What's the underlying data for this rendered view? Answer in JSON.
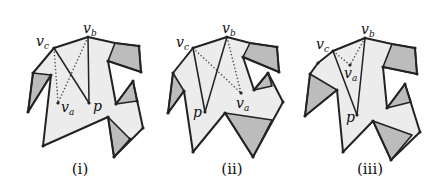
{
  "style": {
    "light_fill": "#ececec",
    "dark_fill": "#bcbcbc",
    "stroke": "#222222",
    "dotted": "#444444"
  },
  "figures": [
    {
      "caption": "(i)",
      "caption_x": 80,
      "outline": [
        [
          54,
          48
        ],
        [
          88,
          37
        ],
        [
          115,
          43
        ],
        [
          139,
          46
        ],
        [
          141,
          72
        ],
        [
          108,
          61
        ],
        [
          116,
          104
        ],
        [
          133,
          81
        ],
        [
          143,
          128
        ],
        [
          114,
          157
        ],
        [
          108,
          117
        ],
        [
          43,
          146
        ],
        [
          51,
          75
        ],
        [
          28,
          112
        ],
        [
          33,
          73
        ]
      ],
      "dark": [
        [
          [
            115,
            43
          ],
          [
            139,
            46
          ],
          [
            141,
            72
          ],
          [
            108,
            61
          ]
        ],
        [
          [
            116,
            104
          ],
          [
            133,
            81
          ],
          [
            137,
            101
          ]
        ],
        [
          [
            108,
            117
          ],
          [
            130,
            139
          ],
          [
            114,
            157
          ]
        ],
        [
          [
            33,
            73
          ],
          [
            51,
            75
          ],
          [
            28,
            112
          ]
        ]
      ],
      "solid_segments": [
        [
          [
            54,
            48
          ],
          [
            89,
            103
          ]
        ],
        [
          [
            88,
            37
          ],
          [
            89,
            103
          ]
        ]
      ],
      "dotted_segments": [
        [
          [
            54,
            48
          ],
          [
            58,
            103
          ]
        ],
        [
          [
            88,
            37
          ],
          [
            58,
            103
          ]
        ]
      ],
      "dots": [
        [
          54,
          48
        ],
        [
          88,
          37
        ],
        [
          139,
          46
        ],
        [
          141,
          72
        ],
        [
          108,
          61
        ],
        [
          133,
          81
        ],
        [
          116,
          104
        ],
        [
          143,
          128
        ],
        [
          114,
          157
        ],
        [
          130,
          139
        ],
        [
          43,
          146
        ],
        [
          28,
          112
        ],
        [
          33,
          73
        ],
        [
          51,
          75
        ],
        [
          58,
          103
        ],
        [
          89,
          103
        ],
        [
          137,
          101
        ],
        [
          108,
          117
        ]
      ],
      "labels": [
        {
          "main": "v",
          "sub": "c",
          "x": 36,
          "y": 46
        },
        {
          "main": "v",
          "sub": "b",
          "x": 83,
          "y": 33
        },
        {
          "main": "v",
          "sub": "a",
          "x": 61,
          "y": 112
        },
        {
          "main": "p",
          "sub": "",
          "x": 93,
          "y": 111
        }
      ]
    },
    {
      "caption": "(ii)",
      "caption_x": 232,
      "outline": [
        [
          193,
          48
        ],
        [
          227,
          37
        ],
        [
          250,
          43
        ],
        [
          277,
          47
        ],
        [
          279,
          72
        ],
        [
          243,
          57
        ],
        [
          254,
          90
        ],
        [
          268,
          73
        ],
        [
          283,
          102
        ],
        [
          253,
          157
        ],
        [
          225,
          113
        ],
        [
          193,
          152
        ],
        [
          184,
          91
        ],
        [
          168,
          113
        ],
        [
          173,
          73
        ]
      ],
      "dark": [
        [
          [
            250,
            43
          ],
          [
            277,
            47
          ],
          [
            279,
            72
          ],
          [
            243,
            57
          ]
        ],
        [
          [
            254,
            90
          ],
          [
            268,
            73
          ],
          [
            272,
            86
          ]
        ],
        [
          [
            225,
            113
          ],
          [
            272,
            120
          ],
          [
            253,
            157
          ]
        ],
        [
          [
            173,
            73
          ],
          [
            184,
            91
          ],
          [
            168,
            113
          ]
        ]
      ],
      "solid_segments": [
        [
          [
            193,
            48
          ],
          [
            205,
            112
          ]
        ],
        [
          [
            227,
            37
          ],
          [
            205,
            112
          ]
        ]
      ],
      "dotted_segments": [
        [
          [
            193,
            48
          ],
          [
            241,
            93
          ]
        ],
        [
          [
            227,
            37
          ],
          [
            241,
            93
          ]
        ]
      ],
      "dots": [
        [
          193,
          48
        ],
        [
          227,
          37
        ],
        [
          277,
          47
        ],
        [
          279,
          72
        ],
        [
          243,
          57
        ],
        [
          254,
          90
        ],
        [
          268,
          73
        ],
        [
          283,
          102
        ],
        [
          253,
          157
        ],
        [
          225,
          113
        ],
        [
          193,
          152
        ],
        [
          184,
          91
        ],
        [
          168,
          113
        ],
        [
          173,
          73
        ],
        [
          205,
          112
        ],
        [
          241,
          93
        ]
      ],
      "labels": [
        {
          "main": "v",
          "sub": "c",
          "x": 176,
          "y": 47
        },
        {
          "main": "v",
          "sub": "b",
          "x": 222,
          "y": 33
        },
        {
          "main": "v",
          "sub": "a",
          "x": 236,
          "y": 108
        },
        {
          "main": "p",
          "sub": "",
          "x": 193,
          "y": 117
        }
      ]
    },
    {
      "caption": "(iii)",
      "caption_x": 370,
      "outline": [
        [
          333,
          51
        ],
        [
          365,
          38
        ],
        [
          392,
          44
        ],
        [
          415,
          48
        ],
        [
          417,
          74
        ],
        [
          383,
          67
        ],
        [
          387,
          108
        ],
        [
          405,
          84
        ],
        [
          420,
          132
        ],
        [
          391,
          160
        ],
        [
          373,
          121
        ],
        [
          343,
          152
        ],
        [
          337,
          90
        ],
        [
          305,
          116
        ],
        [
          310,
          74
        ],
        [
          318,
          63
        ]
      ],
      "dark": [
        [
          [
            392,
            44
          ],
          [
            415,
            48
          ],
          [
            417,
            74
          ],
          [
            383,
            67
          ]
        ],
        [
          [
            387,
            108
          ],
          [
            405,
            84
          ],
          [
            411,
            102
          ]
        ],
        [
          [
            373,
            121
          ],
          [
            412,
            135
          ],
          [
            391,
            160
          ]
        ],
        [
          [
            310,
            74
          ],
          [
            337,
            90
          ],
          [
            305,
            116
          ]
        ]
      ],
      "solid_segments": [
        [
          [
            333,
            51
          ],
          [
            357,
            115
          ]
        ],
        [
          [
            365,
            38
          ],
          [
            357,
            115
          ]
        ]
      ],
      "dotted_segments": [
        [
          [
            333,
            51
          ],
          [
            350,
            65
          ]
        ],
        [
          [
            365,
            38
          ],
          [
            350,
            65
          ]
        ]
      ],
      "dots": [
        [
          333,
          51
        ],
        [
          365,
          38
        ],
        [
          415,
          48
        ],
        [
          417,
          74
        ],
        [
          383,
          67
        ],
        [
          387,
          108
        ],
        [
          405,
          84
        ],
        [
          420,
          132
        ],
        [
          391,
          160
        ],
        [
          373,
          121
        ],
        [
          343,
          152
        ],
        [
          337,
          90
        ],
        [
          305,
          116
        ],
        [
          310,
          74
        ],
        [
          318,
          63
        ],
        [
          357,
          115
        ],
        [
          350,
          65
        ]
      ],
      "labels": [
        {
          "main": "v",
          "sub": "c",
          "x": 316,
          "y": 49
        },
        {
          "main": "v",
          "sub": "b",
          "x": 361,
          "y": 34
        },
        {
          "main": "v",
          "sub": "a",
          "x": 344,
          "y": 78
        },
        {
          "main": "p",
          "sub": "",
          "x": 346,
          "y": 122
        }
      ]
    }
  ]
}
